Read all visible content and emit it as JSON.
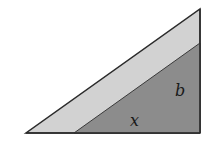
{
  "diagram": {
    "outer_triangle": {
      "points": [
        [
          26,
          133
        ],
        [
          200,
          133
        ],
        [
          200,
          9
        ]
      ],
      "fill": "#d2d2d2",
      "stroke": "#2b2b2b"
    },
    "inner_triangle": {
      "points": [
        [
          74,
          133
        ],
        [
          200,
          133
        ],
        [
          200,
          43
        ]
      ],
      "fill": "#8c8c8c",
      "stroke": "#3a3a3a"
    },
    "labels": {
      "b": "b",
      "x": "x"
    }
  }
}
